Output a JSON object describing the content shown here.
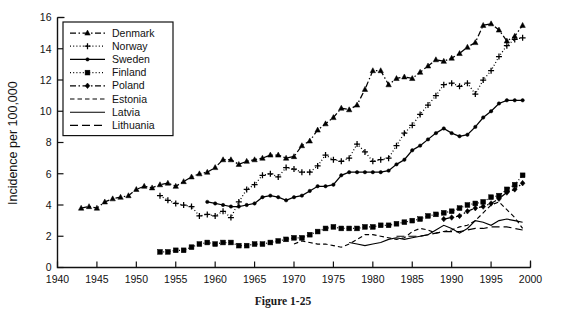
{
  "figure": {
    "caption": "Figure 1-25"
  },
  "chart_data": {
    "type": "line",
    "title": "",
    "xlabel": "",
    "ylabel": "Incidence per 100,000",
    "xlim": [
      1940,
      2000
    ],
    "ylim": [
      0,
      16
    ],
    "xticks": [
      1940,
      1945,
      1950,
      1955,
      1960,
      1965,
      1970,
      1975,
      1980,
      1985,
      1990,
      1995,
      2000
    ],
    "yticks": [
      0,
      2,
      4,
      6,
      8,
      10,
      12,
      14,
      16
    ],
    "grid": false,
    "legend_position": "top-left",
    "series": [
      {
        "name": "Denmark",
        "marker": "triangle",
        "linestyle": "dash-dot",
        "x": [
          1943,
          1944,
          1945,
          1946,
          1947,
          1948,
          1949,
          1950,
          1951,
          1952,
          1953,
          1954,
          1955,
          1956,
          1957,
          1958,
          1959,
          1960,
          1961,
          1962,
          1963,
          1964,
          1965,
          1966,
          1967,
          1968,
          1969,
          1970,
          1971,
          1972,
          1973,
          1974,
          1975,
          1976,
          1977,
          1978,
          1979,
          1980,
          1981,
          1982,
          1983,
          1984,
          1985,
          1986,
          1987,
          1988,
          1989,
          1990,
          1991,
          1992,
          1993,
          1994,
          1995,
          1996,
          1997,
          1998,
          1999
        ],
        "y": [
          3.8,
          3.9,
          3.8,
          4.2,
          4.4,
          4.5,
          4.6,
          5.0,
          5.2,
          5.1,
          5.3,
          5.4,
          5.2,
          5.5,
          5.8,
          6.0,
          6.1,
          6.4,
          6.9,
          6.9,
          6.6,
          6.8,
          6.9,
          7.0,
          7.2,
          7.2,
          7.0,
          7.1,
          7.8,
          8.1,
          8.8,
          9.2,
          9.6,
          10.2,
          10.1,
          10.4,
          11.4,
          12.6,
          12.6,
          11.7,
          12.1,
          12.2,
          12.1,
          12.5,
          12.9,
          13.3,
          13.2,
          13.4,
          13.7,
          14.1,
          14.4,
          15.5,
          15.6,
          15.2,
          14.5,
          14.8,
          15.5
        ]
      },
      {
        "name": "Norway",
        "marker": "plus",
        "linestyle": "dotted",
        "x": [
          1953,
          1954,
          1955,
          1956,
          1957,
          1958,
          1959,
          1960,
          1961,
          1962,
          1963,
          1964,
          1965,
          1966,
          1967,
          1968,
          1969,
          1970,
          1971,
          1972,
          1973,
          1974,
          1975,
          1976,
          1977,
          1978,
          1979,
          1980,
          1981,
          1982,
          1983,
          1984,
          1985,
          1986,
          1987,
          1988,
          1989,
          1990,
          1991,
          1992,
          1993,
          1994,
          1995,
          1996,
          1997,
          1998,
          1999
        ],
        "y": [
          4.6,
          4.3,
          4.1,
          4.0,
          3.9,
          3.3,
          3.4,
          3.3,
          3.6,
          3.2,
          4.2,
          5.0,
          5.3,
          5.9,
          6.0,
          5.8,
          6.4,
          6.3,
          6.1,
          6.1,
          6.5,
          7.2,
          6.9,
          6.8,
          7.0,
          7.9,
          7.4,
          6.8,
          6.9,
          7.0,
          7.8,
          8.6,
          9.1,
          9.8,
          10.4,
          11.0,
          11.7,
          11.8,
          11.6,
          11.8,
          11.1,
          12.0,
          12.6,
          13.5,
          14.2,
          14.6,
          14.7
        ]
      },
      {
        "name": "Sweden",
        "marker": "dot",
        "linestyle": "solid",
        "x": [
          1959,
          1960,
          1961,
          1962,
          1963,
          1964,
          1965,
          1966,
          1967,
          1968,
          1969,
          1970,
          1971,
          1972,
          1973,
          1974,
          1975,
          1976,
          1977,
          1978,
          1979,
          1980,
          1981,
          1982,
          1983,
          1984,
          1985,
          1986,
          1987,
          1988,
          1989,
          1990,
          1991,
          1992,
          1993,
          1994,
          1995,
          1996,
          1997,
          1998,
          1999
        ],
        "y": [
          4.2,
          4.1,
          4.0,
          3.9,
          3.9,
          4.0,
          4.1,
          4.5,
          4.6,
          4.5,
          4.3,
          4.5,
          4.6,
          4.9,
          5.2,
          5.2,
          5.3,
          5.9,
          6.1,
          6.1,
          6.1,
          6.1,
          6.1,
          6.2,
          6.6,
          6.9,
          7.5,
          7.8,
          8.2,
          8.6,
          8.9,
          8.6,
          8.4,
          8.5,
          9.0,
          9.6,
          10.0,
          10.5,
          10.7,
          10.7,
          10.7
        ]
      },
      {
        "name": "Finland",
        "marker": "square",
        "linestyle": "dotted",
        "x": [
          1953,
          1954,
          1955,
          1956,
          1957,
          1958,
          1959,
          1960,
          1961,
          1962,
          1963,
          1964,
          1965,
          1966,
          1967,
          1968,
          1969,
          1970,
          1971,
          1972,
          1973,
          1974,
          1975,
          1976,
          1977,
          1978,
          1979,
          1980,
          1981,
          1982,
          1983,
          1984,
          1985,
          1986,
          1987,
          1988,
          1989,
          1990,
          1991,
          1992,
          1993,
          1994,
          1995,
          1996,
          1997,
          1998,
          1999
        ],
        "y": [
          1.0,
          1.0,
          1.1,
          1.1,
          1.3,
          1.5,
          1.6,
          1.5,
          1.6,
          1.6,
          1.4,
          1.4,
          1.5,
          1.5,
          1.6,
          1.7,
          1.8,
          1.9,
          1.9,
          2.1,
          2.3,
          2.5,
          2.6,
          2.5,
          2.5,
          2.5,
          2.6,
          2.6,
          2.7,
          2.7,
          2.8,
          2.9,
          3.0,
          3.1,
          3.3,
          3.4,
          3.5,
          3.6,
          3.8,
          4.0,
          4.1,
          4.2,
          4.5,
          4.6,
          5.0,
          5.3,
          5.9
        ]
      },
      {
        "name": "Poland",
        "marker": "diamond",
        "linestyle": "dash-dot",
        "x": [
          1989,
          1990,
          1991,
          1992,
          1993,
          1994,
          1995,
          1996,
          1997,
          1998,
          1999
        ],
        "y": [
          3.1,
          3.2,
          3.3,
          3.6,
          3.8,
          3.9,
          4.1,
          4.4,
          4.8,
          5.0,
          5.4
        ]
      },
      {
        "name": "Estonia",
        "marker": "none",
        "linestyle": "dashed",
        "x": [
          1970,
          1971,
          1972,
          1973,
          1974,
          1975,
          1976,
          1977,
          1978,
          1979,
          1980,
          1981,
          1982,
          1983,
          1984,
          1985,
          1986,
          1987,
          1988,
          1989,
          1990,
          1991,
          1992,
          1993,
          1994,
          1995,
          1996,
          1997,
          1998,
          1999
        ],
        "y": [
          1.5,
          1.7,
          1.6,
          1.5,
          1.5,
          1.4,
          1.3,
          1.5,
          1.8,
          2.1,
          2.1,
          2.0,
          1.9,
          1.8,
          1.9,
          2.3,
          2.5,
          2.4,
          2.2,
          2.3,
          2.4,
          2.6,
          2.7,
          3.0,
          3.5,
          4.0,
          4.2,
          3.7,
          3.2,
          2.5
        ]
      },
      {
        "name": "Latvia",
        "marker": "none",
        "linestyle": "solid",
        "x": [
          1977,
          1978,
          1979,
          1980,
          1981,
          1982,
          1983,
          1984,
          1985,
          1986,
          1987,
          1988,
          1989,
          1990,
          1991,
          1992,
          1993,
          1994,
          1995,
          1996,
          1997,
          1998,
          1999
        ],
        "y": [
          1.6,
          1.5,
          1.4,
          1.5,
          1.6,
          1.8,
          1.9,
          1.8,
          1.9,
          2.0,
          2.1,
          2.4,
          2.7,
          2.5,
          2.2,
          2.5,
          3.0,
          2.9,
          2.7,
          3.0,
          3.1,
          3.0,
          2.9
        ]
      },
      {
        "name": "Lithuania",
        "marker": "none",
        "linestyle": "longdash",
        "x": [
          1983,
          1984,
          1985,
          1986,
          1987,
          1988,
          1989,
          1990,
          1991,
          1992,
          1993,
          1994,
          1995,
          1996,
          1997,
          1998,
          1999
        ],
        "y": [
          2.0,
          2.0,
          2.0,
          2.0,
          2.1,
          2.2,
          2.3,
          2.3,
          2.3,
          2.4,
          2.5,
          2.5,
          2.6,
          2.6,
          2.6,
          2.5,
          2.4
        ]
      }
    ]
  },
  "legend": {
    "items": [
      {
        "label": "Denmark"
      },
      {
        "label": "Norway"
      },
      {
        "label": "Sweden"
      },
      {
        "label": "Finland"
      },
      {
        "label": "Poland"
      },
      {
        "label": "Estonia"
      },
      {
        "label": "Latvia"
      },
      {
        "label": "Lithuania"
      }
    ]
  }
}
